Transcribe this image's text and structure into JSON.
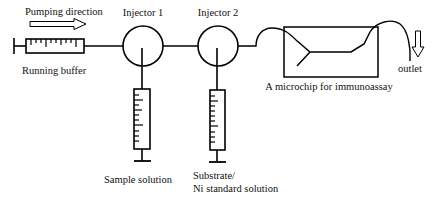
{
  "diagram": {
    "labels": {
      "pumping_direction": "Pumping direction",
      "running_buffer": "Running buffer",
      "injector_1": "Injector 1",
      "injector_2": "Injector 2",
      "microchip": "A microchip for immunoassay",
      "outlet": "outlet",
      "sample_solution": "Sample solution",
      "substrate_line1": "Substrate/",
      "substrate_line2": "Ni standard solution"
    },
    "colors": {
      "line": "#000000",
      "background": "#ffffff"
    }
  }
}
